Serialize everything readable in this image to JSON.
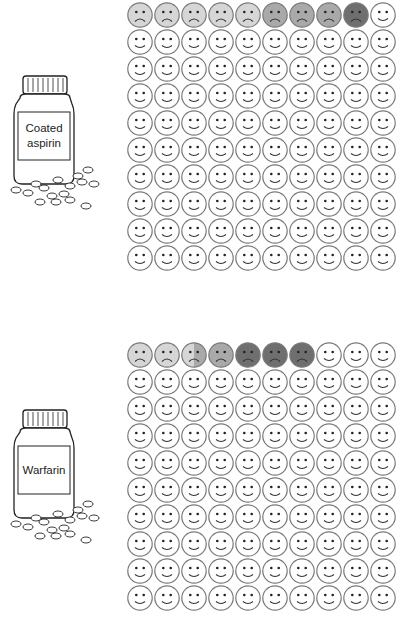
{
  "colors": {
    "happy": "#ffffff",
    "light": "#d6d6d6",
    "medium": "#a9a9a9",
    "dark": "#6f6f6f",
    "stroke": "#7a7a7a"
  },
  "panels": [
    {
      "drug": "Coated aspirin",
      "label_lines": [
        "Coated",
        "aspirin"
      ],
      "grid_rows": 10,
      "grid_cols": 10,
      "top_row": [
        "light",
        "light",
        "light",
        "light",
        "light",
        "medium",
        "medium",
        "medium",
        "dark",
        "happy"
      ]
    },
    {
      "drug": "Warfarin",
      "label_lines": [
        "Warfarin"
      ],
      "grid_rows": 10,
      "grid_cols": 10,
      "top_row": [
        "light",
        "light",
        "light-medium",
        "medium",
        "dark",
        "dark",
        "dark",
        "happy",
        "happy",
        "happy"
      ]
    }
  ]
}
